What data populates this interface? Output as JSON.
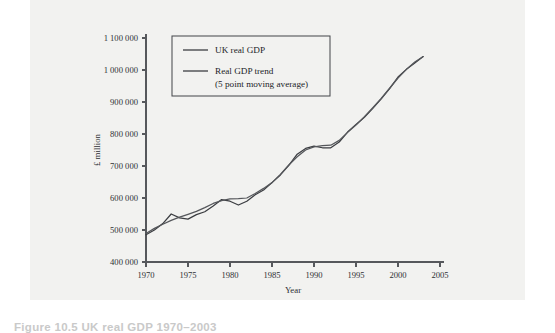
{
  "figure": {
    "caption": "Figure 10.5  UK real GDP 1970–2003",
    "panel_background": "#f2f2f0"
  },
  "chart_data": {
    "type": "line",
    "title": "",
    "xlabel": "Year",
    "ylabel": "£ million",
    "xlim": [
      1970,
      2005
    ],
    "ylim": [
      400000,
      1100000
    ],
    "xticks": [
      1970,
      1975,
      1980,
      1985,
      1990,
      1995,
      2000,
      2005
    ],
    "xtick_labels": [
      "1970",
      "1975",
      "1980",
      "1985",
      "1990",
      "1995",
      "2000",
      "2005"
    ],
    "yticks": [
      400000,
      500000,
      600000,
      700000,
      800000,
      900000,
      1000000,
      1100000
    ],
    "ytick_labels": [
      "400 000",
      "500 000",
      "600 000",
      "700 000",
      "800 000",
      "900 000",
      "1 000 000",
      "1 100 000"
    ],
    "grid": false,
    "legend_position": "upper-left-inside",
    "colors": {
      "actual": "#3b3d41",
      "trend": "#55575b",
      "axis": "#56585c"
    },
    "x": [
      1970,
      1971,
      1972,
      1973,
      1974,
      1975,
      1976,
      1977,
      1978,
      1979,
      1980,
      1981,
      1982,
      1983,
      1984,
      1985,
      1986,
      1987,
      1988,
      1989,
      1990,
      1991,
      1992,
      1993,
      1994,
      1995,
      1996,
      1997,
      1998,
      1999,
      2000,
      2001,
      2002,
      2003
    ],
    "series": [
      {
        "name": "UK real GDP",
        "color": "#3b3d41",
        "values": [
          485000,
          500000,
          520000,
          550000,
          538000,
          534000,
          548000,
          557000,
          575000,
          595000,
          590000,
          578000,
          590000,
          610000,
          625000,
          648000,
          672000,
          702000,
          737000,
          755000,
          762000,
          757000,
          757000,
          775000,
          806000,
          830000,
          852000,
          880000,
          910000,
          942000,
          978000,
          1002000,
          1022000,
          1042000
        ]
      },
      {
        "name": "Real GDP trend (5 point moving average)",
        "color": "#55575b",
        "values": [
          489000,
          505000,
          518000,
          530000,
          540000,
          549000,
          558000,
          570000,
          583000,
          592000,
          597000,
          598000,
          600000,
          614000,
          630000,
          648000,
          674000,
          703000,
          729000,
          750000,
          760000,
          764000,
          765000,
          780000,
          805000,
          828000,
          854000,
          882000,
          911000,
          943000,
          975000,
          1002000,
          1025000,
          1042000
        ]
      }
    ],
    "legend": [
      {
        "label": "UK real GDP",
        "sub": ""
      },
      {
        "label": "Real GDP trend",
        "sub": "(5 point moving average)"
      }
    ]
  }
}
